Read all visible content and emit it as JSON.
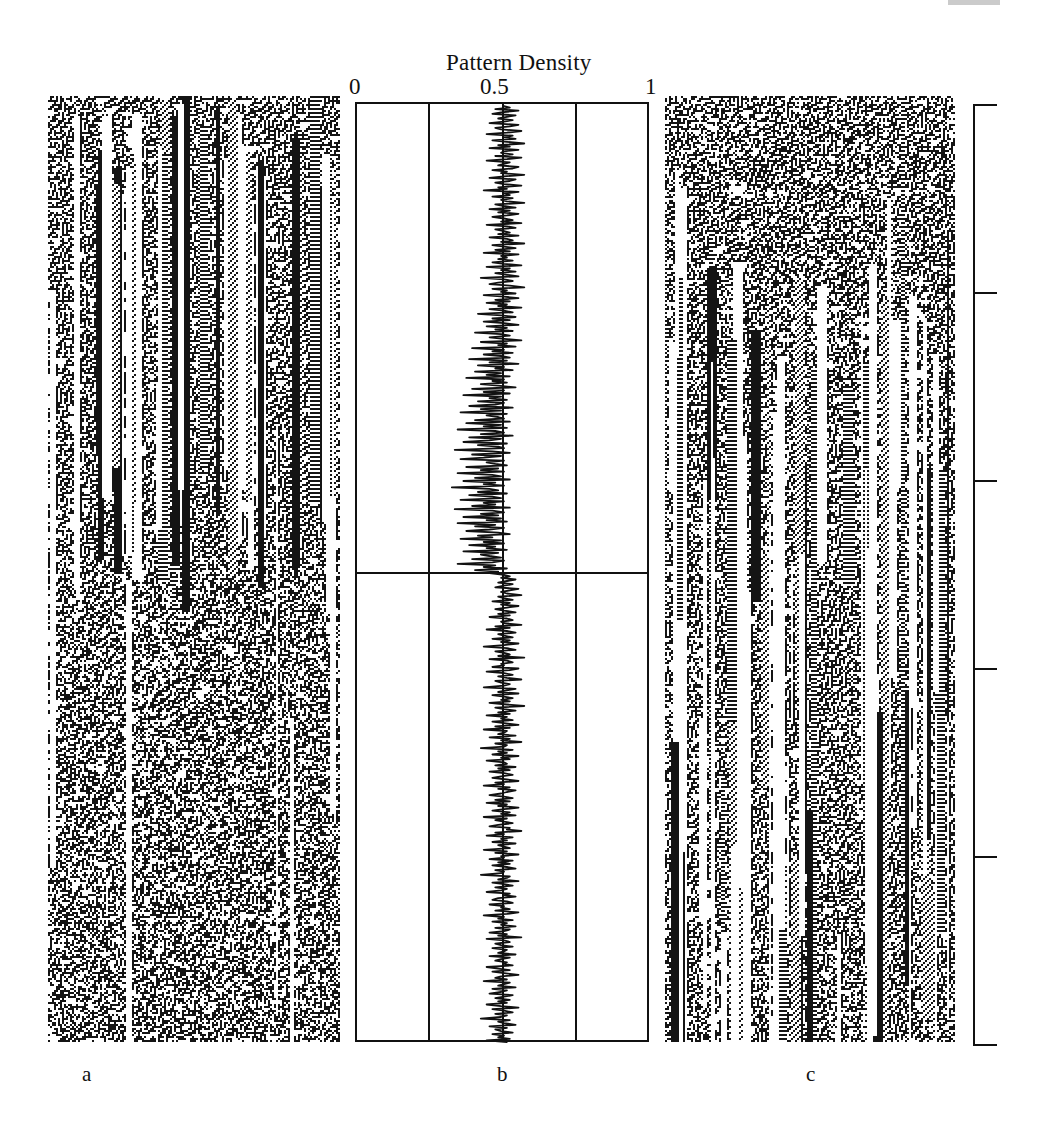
{
  "figure": {
    "panels": [
      {
        "id": "a",
        "label": "a",
        "kind": "cellular-automaton-spacetime"
      },
      {
        "id": "b",
        "label": "b",
        "kind": "line-plot"
      },
      {
        "id": "c",
        "label": "c",
        "kind": "cellular-automaton-spacetime"
      }
    ]
  },
  "panel_b": {
    "title": "Pattern Density",
    "tick_labels": [
      "0",
      "0.5",
      "1"
    ]
  },
  "chart_data": {
    "type": "line",
    "title": "Pattern Density",
    "xlabel": "Pattern Density",
    "ylabel": "",
    "orientation": "vertical-time-down",
    "xlim": [
      0,
      1
    ],
    "ylim": [
      0,
      600
    ],
    "grid": true,
    "gridlines_x": [
      0,
      0.25,
      0.5,
      0.75,
      1
    ],
    "xticks": [
      0,
      0.5,
      1
    ],
    "xticklabels": [
      "0",
      "0.5",
      "1"
    ],
    "legend": "none",
    "annotations": [
      {
        "type": "hline",
        "y": 300,
        "note": "regime boundary between structured and chaotic phase"
      }
    ],
    "series": [
      {
        "name": "Pattern Density",
        "mean_phase1": 0.5,
        "mean_phase2": 0.5,
        "values": [
          0.5,
          0.52,
          0.47,
          0.55,
          0.49,
          0.46,
          0.54,
          0.51,
          0.48,
          0.53,
          0.5,
          0.45,
          0.55,
          0.52,
          0.47,
          0.49,
          0.56,
          0.51,
          0.44,
          0.53,
          0.5,
          0.54,
          0.46,
          0.51,
          0.57,
          0.48,
          0.52,
          0.45,
          0.55,
          0.5,
          0.49,
          0.53,
          0.47,
          0.56,
          0.51,
          0.44,
          0.52,
          0.5,
          0.48,
          0.55,
          0.53,
          0.46,
          0.51,
          0.49,
          0.57,
          0.5,
          0.45,
          0.54,
          0.52,
          0.47,
          0.5,
          0.56,
          0.48,
          0.51,
          0.43,
          0.55,
          0.5,
          0.52,
          0.46,
          0.53,
          0.49,
          0.51,
          0.57,
          0.47,
          0.5,
          0.54,
          0.45,
          0.52,
          0.48,
          0.55,
          0.51,
          0.46,
          0.5,
          0.53,
          0.49,
          0.56,
          0.44,
          0.51,
          0.54,
          0.47,
          0.5,
          0.52,
          0.48,
          0.55,
          0.45,
          0.51,
          0.53,
          0.49,
          0.57,
          0.46,
          0.5,
          0.54,
          0.47,
          0.52,
          0.43,
          0.55,
          0.49,
          0.51,
          0.48,
          0.53,
          0.46,
          0.5,
          0.56,
          0.44,
          0.52,
          0.49,
          0.54,
          0.47,
          0.51,
          0.55,
          0.42,
          0.5,
          0.53,
          0.48,
          0.45,
          0.52,
          0.57,
          0.46,
          0.51,
          0.49,
          0.54,
          0.43,
          0.5,
          0.55,
          0.47,
          0.52,
          0.44,
          0.51,
          0.48,
          0.56,
          0.45,
          0.5,
          0.53,
          0.41,
          0.49,
          0.54,
          0.46,
          0.52,
          0.43,
          0.5,
          0.55,
          0.44,
          0.51,
          0.47,
          0.53,
          0.4,
          0.49,
          0.52,
          0.45,
          0.5,
          0.56,
          0.42,
          0.51,
          0.48,
          0.54,
          0.39,
          0.5,
          0.46,
          0.53,
          0.43,
          0.49,
          0.52,
          0.38,
          0.51,
          0.45,
          0.55,
          0.41,
          0.5,
          0.47,
          0.53,
          0.4,
          0.49,
          0.44,
          0.52,
          0.37,
          0.5,
          0.46,
          0.51,
          0.42,
          0.48,
          0.54,
          0.39,
          0.5,
          0.43,
          0.52,
          0.36,
          0.49,
          0.45,
          0.51,
          0.41,
          0.5,
          0.47,
          0.38,
          0.53,
          0.42,
          0.49,
          0.35,
          0.51,
          0.44,
          0.48,
          0.5,
          0.4,
          0.52,
          0.37,
          0.49,
          0.43,
          0.51,
          0.34,
          0.47,
          0.5,
          0.42,
          0.53,
          0.38,
          0.49,
          0.45,
          0.36,
          0.51,
          0.41,
          0.48,
          0.5,
          0.33,
          0.46,
          0.52,
          0.39,
          0.49,
          0.43,
          0.35,
          0.5,
          0.44,
          0.47,
          0.51,
          0.37,
          0.48,
          0.42,
          0.5,
          0.34,
          0.46,
          0.49,
          0.4,
          0.52,
          0.36,
          0.47,
          0.43,
          0.5,
          0.32,
          0.45,
          0.48,
          0.41,
          0.51,
          0.38,
          0.46,
          0.49,
          0.35,
          0.5,
          0.43,
          0.47,
          0.39,
          0.52,
          0.33,
          0.46,
          0.5,
          0.42,
          0.48,
          0.36,
          0.49,
          0.44,
          0.51,
          0.34,
          0.47,
          0.4,
          0.5,
          0.45,
          0.37,
          0.48,
          0.52,
          0.41,
          0.46,
          0.35,
          0.49,
          0.43,
          0.5,
          0.38,
          0.47,
          0.44,
          0.51,
          0.36,
          0.48,
          0.42,
          0.45,
          0.49,
          0.39,
          0.5,
          0.46,
          0.34,
          0.47,
          0.43,
          0.51,
          0.4,
          0.48,
          0.45,
          0.5,
          0.52,
          0.49,
          0.54,
          0.51,
          0.48,
          0.53,
          0.5,
          0.47,
          0.55,
          0.52,
          0.49,
          0.51,
          0.56,
          0.48,
          0.5,
          0.53,
          0.46,
          0.52,
          0.49,
          0.55,
          0.51,
          0.47,
          0.5,
          0.54,
          0.48,
          0.52,
          0.45,
          0.51,
          0.53,
          0.49,
          0.5,
          0.56,
          0.47,
          0.52,
          0.44,
          0.51,
          0.54,
          0.48,
          0.5,
          0.53,
          0.46,
          0.52,
          0.49,
          0.55,
          0.5,
          0.43,
          0.51,
          0.54,
          0.47,
          0.5,
          0.52,
          0.48,
          0.57,
          0.45,
          0.51,
          0.53,
          0.49,
          0.5,
          0.46,
          0.55,
          0.52,
          0.44,
          0.5,
          0.53,
          0.48,
          0.51,
          0.56,
          0.47,
          0.49,
          0.52,
          0.5,
          0.43,
          0.54,
          0.51,
          0.48,
          0.55,
          0.46,
          0.5,
          0.53,
          0.49,
          0.52,
          0.45,
          0.51,
          0.57,
          0.47,
          0.5,
          0.54,
          0.48,
          0.52,
          0.44,
          0.51,
          0.49,
          0.53,
          0.46,
          0.5,
          0.55,
          0.47,
          0.52,
          0.43,
          0.51,
          0.5,
          0.48,
          0.54,
          0.45,
          0.52,
          0.49,
          0.56,
          0.47,
          0.51,
          0.5,
          0.42,
          0.53,
          0.48,
          0.51,
          0.46,
          0.55,
          0.49,
          0.52,
          0.44,
          0.5,
          0.51,
          0.47,
          0.54,
          0.48,
          0.52,
          0.45,
          0.5,
          0.53,
          0.49,
          0.46,
          0.51,
          0.55,
          0.47,
          0.5,
          0.43,
          0.52,
          0.48,
          0.54,
          0.51,
          0.49,
          0.45,
          0.5,
          0.53,
          0.47,
          0.52,
          0.44,
          0.51,
          0.48,
          0.55,
          0.5,
          0.46,
          0.52,
          0.49,
          0.54,
          0.43,
          0.51,
          0.47,
          0.5,
          0.53,
          0.48,
          0.45,
          0.52,
          0.51,
          0.56,
          0.47,
          0.5,
          0.44,
          0.53,
          0.49,
          0.51,
          0.46,
          0.54,
          0.48,
          0.5,
          0.52,
          0.43,
          0.51,
          0.47,
          0.55,
          0.49,
          0.5,
          0.45,
          0.53,
          0.48,
          0.52,
          0.46,
          0.51,
          0.54,
          0.47,
          0.5,
          0.49,
          0.42,
          0.52,
          0.51,
          0.48,
          0.55,
          0.46,
          0.5,
          0.53,
          0.47,
          0.51,
          0.49,
          0.44,
          0.52,
          0.5,
          0.54,
          0.48,
          0.46,
          0.51,
          0.53,
          0.45,
          0.5,
          0.49,
          0.52,
          0.47,
          0.55,
          0.51,
          0.43,
          0.5,
          0.48,
          0.53,
          0.46,
          0.51,
          0.49,
          0.54,
          0.47,
          0.52,
          0.5,
          0.45,
          0.51,
          0.48,
          0.56,
          0.44,
          0.5,
          0.52,
          0.47,
          0.49,
          0.53,
          0.46,
          0.51,
          0.5,
          0.48,
          0.54,
          0.45,
          0.52,
          0.49,
          0.47,
          0.51,
          0.5,
          0.53,
          0.44,
          0.48,
          0.52,
          0.46,
          0.5,
          0.55,
          0.49,
          0.47,
          0.51,
          0.43,
          0.52,
          0.5,
          0.48,
          0.54,
          0.46,
          0.51,
          0.49,
          0.45,
          0.53,
          0.5,
          0.47,
          0.52,
          0.48,
          0.51,
          0.44,
          0.49,
          0.55,
          0.46,
          0.5,
          0.53,
          0.47,
          0.51,
          0.49,
          0.42,
          0.52,
          0.48,
          0.5,
          0.54,
          0.45,
          0.51,
          0.47,
          0.49,
          0.53,
          0.46,
          0.5,
          0.48,
          0.52,
          0.44,
          0.51
        ]
      }
    ]
  },
  "right_axis": {
    "orientation": "vertical",
    "tick_count": 6,
    "tick_labels": []
  }
}
